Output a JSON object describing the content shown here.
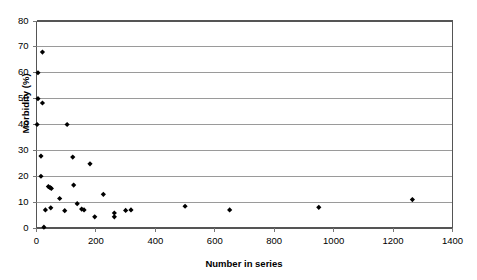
{
  "chart_data": {
    "type": "scatter",
    "title": "",
    "xlabel": "Number in series",
    "ylabel": "Morbidity (%)",
    "xlim": [
      0,
      1400
    ],
    "ylim": [
      0,
      80
    ],
    "xticks": [
      0,
      200,
      400,
      600,
      800,
      1000,
      1200,
      1400
    ],
    "yticks": [
      0,
      10,
      20,
      30,
      40,
      50,
      60,
      70,
      80
    ],
    "grid": "horizontal",
    "legend": "none",
    "marker": "diamond",
    "marker_color": "#000000",
    "series": [
      {
        "name": "Morbidity by series size",
        "points": [
          [
            20,
            68.0
          ],
          [
            5,
            60.0
          ],
          [
            5,
            50.0
          ],
          [
            20,
            48.3
          ],
          [
            2,
            40.0
          ],
          [
            103,
            40.0
          ],
          [
            15,
            27.8
          ],
          [
            122,
            27.4
          ],
          [
            180,
            24.8
          ],
          [
            15,
            20.0
          ],
          [
            40,
            16.0
          ],
          [
            46,
            15.6
          ],
          [
            50,
            15.3
          ],
          [
            125,
            16.6
          ],
          [
            225,
            13.0
          ],
          [
            78,
            11.4
          ],
          [
            137,
            9.4
          ],
          [
            30,
            7.0
          ],
          [
            48,
            7.8
          ],
          [
            95,
            6.7
          ],
          [
            152,
            7.3
          ],
          [
            160,
            7.0
          ],
          [
            196,
            4.3
          ],
          [
            262,
            5.8
          ],
          [
            262,
            4.3
          ],
          [
            300,
            6.8
          ],
          [
            318,
            7.0
          ],
          [
            25,
            0.3
          ],
          [
            500,
            8.4
          ],
          [
            650,
            7.0
          ],
          [
            950,
            8.0
          ],
          [
            1265,
            11.0
          ]
        ]
      }
    ]
  },
  "axes": {
    "y_tick_labels": [
      "0",
      "10",
      "20",
      "30",
      "40",
      "50",
      "60",
      "70",
      "80"
    ],
    "x_tick_labels": [
      "0",
      "200",
      "400",
      "600",
      "800",
      "1000",
      "1200",
      "1400"
    ],
    "x_title": "Number in series",
    "y_title": "Morbidity (%)"
  },
  "colors": {
    "marker": "#000000",
    "gridline": "#9a9a9a",
    "axis": "#555555",
    "background": "#ffffff"
  }
}
